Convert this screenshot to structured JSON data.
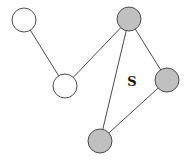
{
  "diagram": {
    "type": "graph",
    "colors": {
      "white_fill": "#ffffff",
      "gray_fill": "#c0c0c0",
      "stroke": "#4a4a4a",
      "background": "#ffffff"
    },
    "nodes": [
      {
        "id": "n1",
        "fill": "white",
        "x": 24,
        "y": 20,
        "r": 12
      },
      {
        "id": "n2",
        "fill": "white",
        "x": 65,
        "y": 86,
        "r": 12
      },
      {
        "id": "n3",
        "fill": "gray",
        "x": 129,
        "y": 19,
        "r": 12
      },
      {
        "id": "n4",
        "fill": "gray",
        "x": 167,
        "y": 80,
        "r": 12
      },
      {
        "id": "n5",
        "fill": "gray",
        "x": 100,
        "y": 141,
        "r": 12
      }
    ],
    "edges": [
      {
        "from": "n1",
        "to": "n2"
      },
      {
        "from": "n2",
        "to": "n3"
      },
      {
        "from": "n3",
        "to": "n4"
      },
      {
        "from": "n3",
        "to": "n5"
      },
      {
        "from": "n4",
        "to": "n5"
      }
    ],
    "labels": [
      {
        "text": "S",
        "x": 132,
        "y": 86
      }
    ]
  }
}
